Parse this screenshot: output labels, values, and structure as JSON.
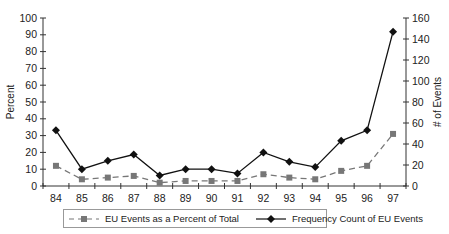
{
  "chart_data": {
    "type": "line",
    "title": "",
    "xlabel": "",
    "ylabel": "Percent",
    "y2label": "# of Events",
    "categories": [
      "84",
      "85",
      "86",
      "87",
      "88",
      "89",
      "90",
      "91",
      "92",
      "93",
      "94",
      "95",
      "96",
      "97"
    ],
    "ylim": [
      0,
      100
    ],
    "y2lim": [
      0,
      160
    ],
    "yticks": [
      0,
      10,
      20,
      30,
      40,
      50,
      60,
      70,
      80,
      90,
      100
    ],
    "y2ticks": [
      0,
      20,
      40,
      60,
      80,
      100,
      120,
      140,
      160
    ],
    "grid": false,
    "legend_position": "bottom",
    "series": [
      {
        "name": "EU Events as a Percent of Total",
        "axis": "left",
        "style": "dashed",
        "marker": "square",
        "color": "#777777",
        "values": [
          12,
          4,
          5,
          6,
          2,
          3,
          3,
          3,
          7,
          5,
          4,
          9,
          12,
          31
        ]
      },
      {
        "name": "Frequency Count of EU Events",
        "axis": "right",
        "style": "solid",
        "marker": "diamond",
        "color": "#111111",
        "values": [
          53,
          16,
          24,
          30,
          10,
          16,
          16,
          12,
          32,
          23,
          18,
          43,
          53,
          147
        ]
      }
    ]
  },
  "legend": {
    "items": [
      {
        "label": "EU Events as a Percent of Total"
      },
      {
        "label": "Frequency Count of EU Events"
      }
    ]
  }
}
